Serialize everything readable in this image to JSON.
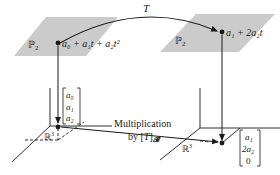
{
  "diagram": {
    "type": "linear-transformation-commutative-diagram",
    "domain_space": {
      "label": "ℙ",
      "subscript": "2"
    },
    "codomain_space": {
      "label": "ℙ",
      "subscript": "2"
    },
    "transformation": {
      "label": "T"
    },
    "input_polynomial": "a₀ + a₁t + a₂t²",
    "output_polynomial": "a₁ + 2a₂t",
    "coordinate_space_left": {
      "label": "ℝ",
      "superscript": "3"
    },
    "coordinate_space_right": {
      "label": "ℝ",
      "superscript": "3"
    },
    "input_vector": [
      "a₀",
      "a₁",
      "a₂"
    ],
    "output_vector": [
      "a₁",
      "2a₂",
      "0"
    ],
    "matrix_map": {
      "line1": "Multiplication",
      "line2_prefix": "by [",
      "line2_T": "T",
      "line2_suffix": "]",
      "basis_subscript": "𝓑"
    },
    "colors": {
      "plane_fill": "#c8c8c8",
      "line": "#1a1a1a",
      "background": "#ffffff"
    }
  }
}
